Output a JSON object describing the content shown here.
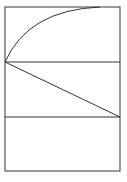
{
  "diagram": {
    "background": "#ffffff",
    "stroke_color": "#333333",
    "outer_rectangle": {
      "x": 5,
      "y": 7,
      "width": 115,
      "height": 164
    },
    "horizontal_lines": [
      {
        "x1": 5,
        "y1": 62,
        "x2": 120,
        "y2": 62
      },
      {
        "x1": 5,
        "y1": 117,
        "x2": 120,
        "y2": 117
      }
    ],
    "diagonal_line": {
      "x1": 5,
      "y1": 62,
      "x2": 120,
      "y2": 117
    },
    "arc": {
      "start": [
        5,
        62
      ],
      "control": [
        28,
        10
      ],
      "end": [
        100,
        7
      ]
    }
  }
}
